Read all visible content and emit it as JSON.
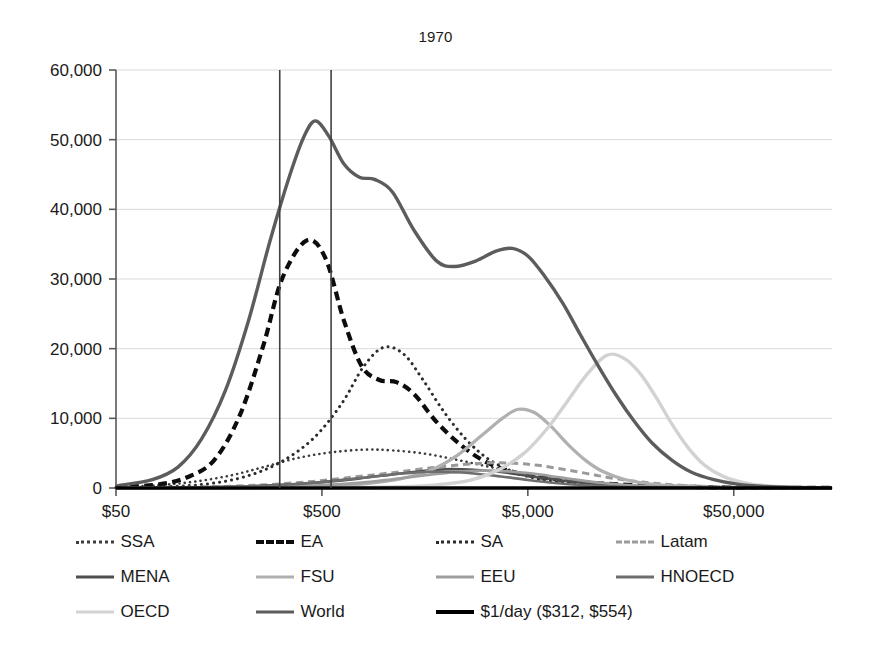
{
  "chart_data": {
    "type": "line",
    "title": "1970",
    "xlabel": "",
    "ylabel": "",
    "xscale": "log",
    "grid": true,
    "legend_position": "bottom",
    "xlim": [
      50,
      150000
    ],
    "ylim": [
      0,
      60000
    ],
    "xticks": [
      "$50",
      "$500",
      "$5,000",
      "$50,000"
    ],
    "xtick_values": [
      50,
      500,
      5000,
      50000
    ],
    "yticks": [
      "0",
      "10,000",
      "20,000",
      "30,000",
      "40,000",
      "50,000",
      "60,000"
    ],
    "ytick_values": [
      0,
      10000,
      20000,
      30000,
      40000,
      50000,
      60000
    ],
    "annotations": [
      {
        "name": "poverty-line-312",
        "type": "vline",
        "x": 312,
        "label": "$312"
      },
      {
        "name": "poverty-line-554",
        "type": "vline",
        "x": 554,
        "label": "$554"
      }
    ],
    "series": [
      {
        "name": "SSA",
        "style": "dotted",
        "color": "#3d3d3d",
        "width": 2.6,
        "peak_x": 900,
        "peak_y": 5500,
        "points": [
          [
            50,
            120
          ],
          [
            80,
            400
          ],
          [
            120,
            900
          ],
          [
            180,
            1800
          ],
          [
            260,
            3000
          ],
          [
            380,
            4300
          ],
          [
            550,
            5100
          ],
          [
            800,
            5500
          ],
          [
            1100,
            5400
          ],
          [
            1600,
            4900
          ],
          [
            2300,
            4000
          ],
          [
            3300,
            3000
          ],
          [
            4800,
            2100
          ],
          [
            7000,
            1350
          ],
          [
            10000,
            800
          ],
          [
            15000,
            450
          ],
          [
            25000,
            200
          ],
          [
            40000,
            90
          ],
          [
            70000,
            40
          ],
          [
            150000,
            10
          ]
        ]
      },
      {
        "name": "EA",
        "style": "dashed-bold",
        "color": "#0d0d0d",
        "width": 4.2,
        "peak_x": 420,
        "peak_y": 35500,
        "points": [
          [
            50,
            100
          ],
          [
            80,
            500
          ],
          [
            110,
            1500
          ],
          [
            150,
            4000
          ],
          [
            200,
            10500
          ],
          [
            260,
            20500
          ],
          [
            320,
            30000
          ],
          [
            420,
            35500
          ],
          [
            520,
            33000
          ],
          [
            640,
            24000
          ],
          [
            780,
            17500
          ],
          [
            950,
            15500
          ],
          [
            1150,
            15200
          ],
          [
            1400,
            13500
          ],
          [
            1800,
            9500
          ],
          [
            2400,
            6000
          ],
          [
            3200,
            3600
          ],
          [
            4400,
            2200
          ],
          [
            6200,
            1400
          ],
          [
            9000,
            900
          ],
          [
            13000,
            550
          ],
          [
            20000,
            300
          ],
          [
            32000,
            150
          ],
          [
            55000,
            60
          ],
          [
            150000,
            10
          ]
        ]
      },
      {
        "name": "SA",
        "style": "dotted",
        "color": "#2b2b2b",
        "width": 3.0,
        "peak_x": 1000,
        "peak_y": 20200,
        "points": [
          [
            50,
            40
          ],
          [
            90,
            200
          ],
          [
            140,
            600
          ],
          [
            210,
            1600
          ],
          [
            310,
            3600
          ],
          [
            450,
            7000
          ],
          [
            620,
            12000
          ],
          [
            800,
            17500
          ],
          [
            1000,
            20200
          ],
          [
            1250,
            19200
          ],
          [
            1550,
            15500
          ],
          [
            1950,
            11000
          ],
          [
            2500,
            7000
          ],
          [
            3200,
            4200
          ],
          [
            4200,
            2400
          ],
          [
            5600,
            1300
          ],
          [
            7800,
            700
          ],
          [
            11000,
            380
          ],
          [
            17000,
            180
          ],
          [
            28000,
            80
          ],
          [
            50000,
            30
          ],
          [
            150000,
            5
          ]
        ]
      },
      {
        "name": "Latam",
        "style": "dashed-light",
        "color": "#9a9a9a",
        "width": 3.0,
        "peak_x": 3200,
        "peak_y": 3600,
        "points": [
          [
            50,
            20
          ],
          [
            100,
            80
          ],
          [
            170,
            220
          ],
          [
            280,
            500
          ],
          [
            450,
            950
          ],
          [
            700,
            1550
          ],
          [
            1100,
            2200
          ],
          [
            1700,
            2900
          ],
          [
            2400,
            3350
          ],
          [
            3200,
            3600
          ],
          [
            4300,
            3550
          ],
          [
            5600,
            3250
          ],
          [
            7400,
            2700
          ],
          [
            9800,
            2050
          ],
          [
            13000,
            1400
          ],
          [
            18000,
            850
          ],
          [
            25000,
            480
          ],
          [
            35000,
            250
          ],
          [
            55000,
            100
          ],
          [
            90000,
            30
          ],
          [
            150000,
            8
          ]
        ]
      },
      {
        "name": "MENA",
        "style": "solid",
        "color": "#4f4f4f",
        "width": 2.6,
        "peak_x": 2000,
        "peak_y": 2700,
        "points": [
          [
            50,
            10
          ],
          [
            100,
            60
          ],
          [
            180,
            180
          ],
          [
            300,
            420
          ],
          [
            480,
            800
          ],
          [
            750,
            1350
          ],
          [
            1100,
            1950
          ],
          [
            1550,
            2450
          ],
          [
            2000,
            2700
          ],
          [
            2600,
            2650
          ],
          [
            3400,
            2400
          ],
          [
            4500,
            1950
          ],
          [
            6000,
            1400
          ],
          [
            8200,
            900
          ],
          [
            11500,
            520
          ],
          [
            16000,
            280
          ],
          [
            23000,
            140
          ],
          [
            35000,
            60
          ],
          [
            60000,
            20
          ],
          [
            150000,
            5
          ]
        ]
      },
      {
        "name": "FSU",
        "style": "solid",
        "color": "#b0b0b0",
        "width": 3.2,
        "peak_x": 4500,
        "peak_y": 11300,
        "points": [
          [
            50,
            5
          ],
          [
            150,
            30
          ],
          [
            300,
            100
          ],
          [
            500,
            250
          ],
          [
            800,
            600
          ],
          [
            1200,
            1300
          ],
          [
            1700,
            2600
          ],
          [
            2300,
            4800
          ],
          [
            3000,
            7600
          ],
          [
            3800,
            10100
          ],
          [
            4500,
            11300
          ],
          [
            5400,
            10800
          ],
          [
            6500,
            8800
          ],
          [
            7800,
            6300
          ],
          [
            9500,
            4000
          ],
          [
            11500,
            2400
          ],
          [
            14500,
            1300
          ],
          [
            19000,
            650
          ],
          [
            26000,
            300
          ],
          [
            38000,
            120
          ],
          [
            60000,
            40
          ],
          [
            150000,
            8
          ]
        ]
      },
      {
        "name": "EEU",
        "style": "solid",
        "color": "#9e9e9e",
        "width": 2.8,
        "peak_x": 3000,
        "peak_y": 2500,
        "points": [
          [
            50,
            5
          ],
          [
            120,
            40
          ],
          [
            250,
            130
          ],
          [
            450,
            340
          ],
          [
            750,
            720
          ],
          [
            1100,
            1250
          ],
          [
            1600,
            1850
          ],
          [
            2200,
            2300
          ],
          [
            3000,
            2500
          ],
          [
            4000,
            2400
          ],
          [
            5300,
            2050
          ],
          [
            7000,
            1550
          ],
          [
            9200,
            1050
          ],
          [
            12500,
            620
          ],
          [
            17000,
            330
          ],
          [
            24000,
            160
          ],
          [
            35000,
            70
          ],
          [
            55000,
            25
          ],
          [
            150000,
            5
          ]
        ]
      },
      {
        "name": "HNOECD",
        "style": "solid",
        "color": "#6e6e6e",
        "width": 2.6,
        "peak_x": 1600,
        "peak_y": 2300,
        "points": [
          [
            50,
            8
          ],
          [
            100,
            50
          ],
          [
            180,
            160
          ],
          [
            300,
            400
          ],
          [
            500,
            850
          ],
          [
            750,
            1400
          ],
          [
            1100,
            1950
          ],
          [
            1600,
            2300
          ],
          [
            2100,
            2300
          ],
          [
            2800,
            2050
          ],
          [
            3700,
            1650
          ],
          [
            5000,
            1150
          ],
          [
            6800,
            720
          ],
          [
            9200,
            420
          ],
          [
            13000,
            210
          ],
          [
            19000,
            95
          ],
          [
            28000,
            40
          ],
          [
            45000,
            15
          ],
          [
            150000,
            4
          ]
        ]
      },
      {
        "name": "OECD",
        "style": "solid",
        "color": "#d2d2d2",
        "width": 3.4,
        "peak_x": 12000,
        "peak_y": 19000,
        "points": [
          [
            50,
            2
          ],
          [
            300,
            15
          ],
          [
            700,
            60
          ],
          [
            1200,
            180
          ],
          [
            1800,
            450
          ],
          [
            2600,
            1100
          ],
          [
            3600,
            2600
          ],
          [
            4800,
            5000
          ],
          [
            6200,
            8500
          ],
          [
            7800,
            12500
          ],
          [
            9500,
            16000
          ],
          [
            12000,
            19000
          ],
          [
            14500,
            18700
          ],
          [
            17500,
            16500
          ],
          [
            21000,
            13000
          ],
          [
            25000,
            9200
          ],
          [
            30000,
            5800
          ],
          [
            36000,
            3300
          ],
          [
            45000,
            1600
          ],
          [
            60000,
            600
          ],
          [
            85000,
            180
          ],
          [
            150000,
            30
          ]
        ]
      },
      {
        "name": "World",
        "style": "solid",
        "color": "#5c5c5c",
        "width": 3.4,
        "peak_x": 465,
        "peak_y": 52700,
        "points": [
          [
            50,
            300
          ],
          [
            75,
            1200
          ],
          [
            100,
            3000
          ],
          [
            130,
            7000
          ],
          [
            170,
            14000
          ],
          [
            220,
            24000
          ],
          [
            280,
            35500
          ],
          [
            350,
            45000
          ],
          [
            410,
            50500
          ],
          [
            465,
            52700
          ],
          [
            540,
            50500
          ],
          [
            640,
            46500
          ],
          [
            760,
            44600
          ],
          [
            900,
            44300
          ],
          [
            1100,
            42500
          ],
          [
            1400,
            37000
          ],
          [
            1800,
            32600
          ],
          [
            2200,
            31800
          ],
          [
            2800,
            32600
          ],
          [
            3500,
            34000
          ],
          [
            4200,
            34400
          ],
          [
            5000,
            33300
          ],
          [
            6000,
            30500
          ],
          [
            7400,
            26500
          ],
          [
            9000,
            22000
          ],
          [
            11000,
            17500
          ],
          [
            13500,
            13200
          ],
          [
            16500,
            9500
          ],
          [
            20000,
            6500
          ],
          [
            25000,
            4000
          ],
          [
            31000,
            2300
          ],
          [
            40000,
            1200
          ],
          [
            52000,
            550
          ],
          [
            70000,
            220
          ],
          [
            100000,
            70
          ],
          [
            150000,
            20
          ]
        ]
      },
      {
        "name": "$1/day ($312, $554)",
        "style": "solid-black",
        "color": "#000000",
        "width": 3.6,
        "peak_x": null,
        "peak_y": null,
        "points": [
          [
            50,
            0
          ],
          [
            150000,
            0
          ]
        ]
      }
    ]
  },
  "legend": {
    "rows": [
      [
        {
          "label": "SSA",
          "style": "dotted",
          "color": "#3d3d3d"
        },
        {
          "label": "EA",
          "style": "dashed-bold",
          "color": "#0d0d0d"
        },
        {
          "label": "SA",
          "style": "dotted",
          "color": "#2b2b2b"
        },
        {
          "label": "Latam",
          "style": "dashed-light",
          "color": "#9a9a9a"
        }
      ],
      [
        {
          "label": "MENA",
          "style": "solid",
          "color": "#4f4f4f"
        },
        {
          "label": "FSU",
          "style": "solid",
          "color": "#b0b0b0"
        },
        {
          "label": "EEU",
          "style": "solid",
          "color": "#9e9e9e"
        },
        {
          "label": "HNOECD",
          "style": "solid",
          "color": "#6e6e6e"
        }
      ],
      [
        {
          "label": "OECD",
          "style": "solid",
          "color": "#d2d2d2"
        },
        {
          "label": "World",
          "style": "solid",
          "color": "#5c5c5c"
        },
        {
          "label": "$1/day ($312, $554)",
          "style": "solid-black",
          "color": "#000000"
        }
      ]
    ]
  }
}
